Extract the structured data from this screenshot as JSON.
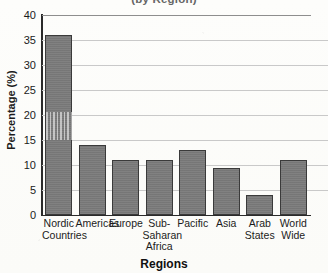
{
  "chart_data": {
    "type": "bar",
    "title": "(by Region)",
    "xlabel": "Regions",
    "ylabel": "Percentage (%)",
    "ylim": [
      0,
      40
    ],
    "ytick_step": 5,
    "yticks": [
      "40",
      "35",
      "30",
      "25",
      "20",
      "15",
      "10",
      "5",
      "0"
    ],
    "grid": true,
    "legend": "none",
    "categories": [
      "Nordic Countries",
      "Americas",
      "Europe",
      "Sub-Saharan Africa",
      "Pacific",
      "Asia",
      "Arab States",
      "World Wide"
    ],
    "category_lines": [
      [
        "Nordic",
        "Countries"
      ],
      [
        "Americas"
      ],
      [
        "Europe"
      ],
      [
        "Sub-",
        "Saharan",
        "Africa"
      ],
      [
        "Pacific"
      ],
      [
        "Asia"
      ],
      [
        "Arab",
        "States"
      ],
      [
        "World",
        "Wide"
      ]
    ],
    "values": [
      36,
      14,
      11,
      11,
      13,
      9.5,
      4,
      11
    ],
    "bar_color": "#7a7a7a",
    "bar_edge_color": "#3a3a3a",
    "grid_color": "#c9c9c9",
    "axis_color": "#2a2a2a",
    "background_color": "#fdfdfb"
  }
}
